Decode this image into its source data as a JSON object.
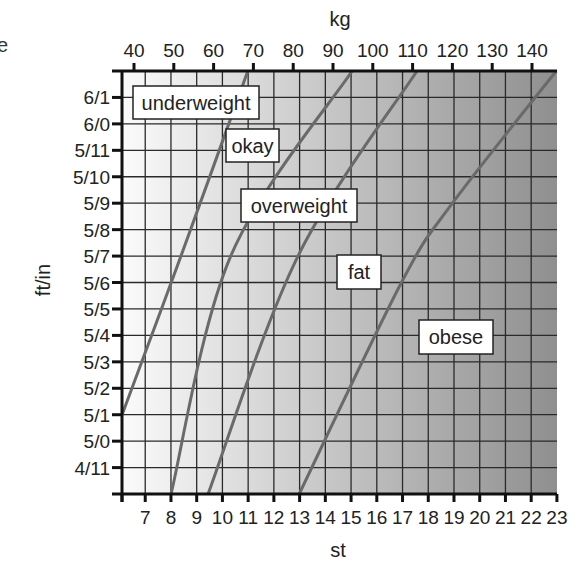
{
  "edge_fragment": "e",
  "colors": {
    "background": "#ffffff",
    "gradient_start": "#fbfbfb",
    "gradient_mid": "#c9c9c9",
    "gradient_end": "#8f8f8f",
    "grid": "#2a2a2a",
    "axis": "#111111",
    "boundary_line": "#6a6a6a",
    "label_box_fill": "#ffffff",
    "label_box_stroke": "#222222"
  },
  "chart_data": {
    "type": "line",
    "title": "",
    "x_axes": {
      "top": {
        "label": "kg",
        "ticks": [
          40,
          50,
          60,
          70,
          80,
          90,
          100,
          110,
          120,
          130,
          140
        ],
        "tick_labels": [
          "40",
          "50",
          "60",
          "70",
          "80",
          "90",
          "100",
          "110",
          "120",
          "130",
          "140"
        ],
        "range": [
          38.1,
          146.1
        ]
      },
      "bottom": {
        "label": "st",
        "ticks": [
          6,
          7,
          8,
          9,
          10,
          11,
          12,
          13,
          14,
          15,
          16,
          17,
          18,
          19,
          20,
          21,
          22,
          23
        ],
        "tick_labels": [
          "",
          "7",
          "8",
          "9",
          "10",
          "11",
          "12",
          "13",
          "14",
          "15",
          "16",
          "17",
          "18",
          "19",
          "20",
          "21",
          "22",
          "23"
        ],
        "range": [
          6,
          23
        ]
      }
    },
    "y_axis": {
      "label": "ft/in",
      "range_inches": [
        58,
        74
      ],
      "ticks_inches": [
        59,
        60,
        61,
        62,
        63,
        64,
        65,
        66,
        67,
        68,
        69,
        70,
        71,
        72,
        73
      ],
      "tick_labels": [
        "4/11",
        "5/0",
        "5/1",
        "5/2",
        "5/3",
        "5/4",
        "5/5",
        "5/6",
        "5/7",
        "5/8",
        "5/9",
        "5/10",
        "5/11",
        "6/0",
        "6/1"
      ]
    },
    "grid": true,
    "series": [
      {
        "name": "underweight / okay boundary",
        "points_kg_in": [
          [
            37.0,
            61
          ],
          [
            51.8,
            67
          ],
          [
            68.6,
            74
          ]
        ]
      },
      {
        "name": "okay / overweight boundary",
        "points_kg_in": [
          [
            49.3,
            58
          ],
          [
            64.3,
            67
          ],
          [
            94.8,
            74
          ]
        ]
      },
      {
        "name": "overweight / fat boundary",
        "points_kg_in": [
          [
            58.6,
            58
          ],
          [
            81.2,
            67
          ],
          [
            111.1,
            74
          ]
        ]
      },
      {
        "name": "fat / obese boundary",
        "points_kg_in": [
          [
            81.5,
            58
          ],
          [
            107.2,
            66
          ],
          [
            120.0,
            69
          ],
          [
            146.1,
            74
          ]
        ]
      }
    ],
    "zones": [
      {
        "label": "underweight",
        "kg": 54.5,
        "in": 72.8
      },
      {
        "label": "okay",
        "kg": 70.0,
        "in": 70.6
      },
      {
        "label": "overweight",
        "kg": 85.0,
        "in": 68.0
      },
      {
        "label": "fat",
        "kg": 96.4,
        "in": 65.3
      },
      {
        "label": "obese",
        "kg": 122.6,
        "in": 63.2
      }
    ]
  },
  "layout": {
    "plot": {
      "left": 122,
      "top": 71,
      "right": 557,
      "bottom": 494
    },
    "kg_px": {
      "kg0": 40,
      "x0": 134,
      "per_kg": 3.98
    },
    "st_px": {
      "st0": 6,
      "x0": 119.5,
      "per_st": 25.73
    },
    "in_px": {
      "in0": 74,
      "y0": 71,
      "per_in": 26.44
    },
    "label_boxes": [
      {
        "label": "underweight",
        "x": 133,
        "y": 86,
        "w": 126,
        "h": 33
      },
      {
        "label": "okay",
        "x": 226,
        "y": 129,
        "w": 53,
        "h": 33
      },
      {
        "label": "overweight",
        "x": 241,
        "y": 189,
        "w": 116,
        "h": 33
      },
      {
        "label": "fat",
        "x": 337,
        "y": 255,
        "w": 44,
        "h": 34
      },
      {
        "label": "obese",
        "x": 419,
        "y": 320,
        "w": 74,
        "h": 34
      }
    ],
    "top_axis_label_pos": {
      "x": 340,
      "y": 26
    },
    "bottom_axis_label_pos": {
      "x": 338,
      "y": 557
    },
    "left_axis_label_pos": {
      "x": 50,
      "y": 280
    }
  }
}
